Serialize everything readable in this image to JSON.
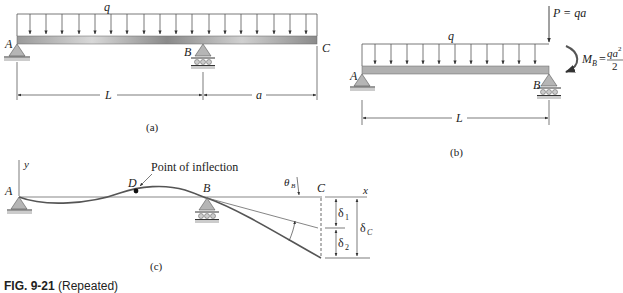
{
  "figure_a": {
    "caption": "(a)",
    "load_label": "q",
    "point_labels": {
      "A": "A",
      "B": "B",
      "C": "C"
    },
    "dimensions": {
      "span_AB": "L",
      "overhang_BC": "a"
    }
  },
  "figure_b": {
    "caption": "(b)",
    "load_label": "q",
    "point_labels": {
      "A": "A",
      "B": "B"
    },
    "point_load": "P = qa",
    "moment_label_lhs": "M",
    "moment_label_sub": "B",
    "moment_num": "qa",
    "moment_num_exp": "2",
    "moment_den": "2",
    "dimensions": {
      "span_AB": "L"
    }
  },
  "figure_c": {
    "caption": "(c)",
    "axis_y": "y",
    "axis_x": "x",
    "point_labels": {
      "A": "A",
      "B": "B",
      "C": "C",
      "D": "D"
    },
    "inflection_label": "Point of inflection",
    "slope_label": "θ",
    "slope_sub": "B",
    "deflections": {
      "d1": "δ",
      "d1_sub": "1",
      "d2": "δ",
      "d2_sub": "2",
      "dC": "δ",
      "dC_sub": "C"
    }
  },
  "figure_caption": {
    "number": "FIG. 9-21",
    "text": "(Repeated)"
  }
}
